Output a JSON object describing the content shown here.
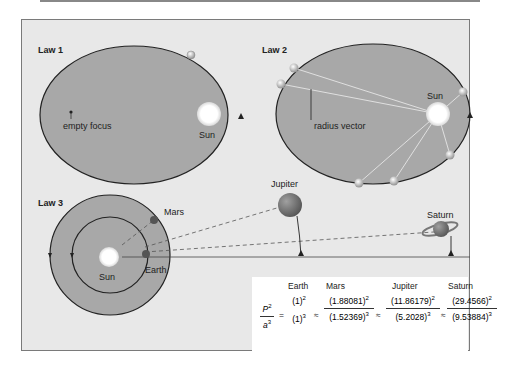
{
  "diagram": {
    "panels": [
      {
        "id": "law1",
        "label": "Law 1",
        "annotations": [
          "empty focus",
          "Sun"
        ]
      },
      {
        "id": "law2",
        "label": "Law 2",
        "annotations": [
          "radius vector",
          "Sun"
        ]
      },
      {
        "id": "law3",
        "label": "Law 3",
        "annotations": [
          "Mars",
          "Sun",
          "Earth",
          "Jupiter",
          "Saturn"
        ]
      }
    ],
    "equation": {
      "lhs": {
        "num": "P",
        "num_exp": "2",
        "den": "a",
        "den_exp": "3"
      },
      "eq_sign": "=",
      "approx_sign": "≈",
      "terms": [
        {
          "planet": "Earth",
          "num": "(1)",
          "num_exp": "2",
          "den": "(1)",
          "den_exp": "3"
        },
        {
          "planet": "Mars",
          "num": "(1.88081)",
          "num_exp": "2",
          "den": "(1.52369)",
          "den_exp": "3"
        },
        {
          "planet": "Jupiter",
          "num": "(11.86179)",
          "num_exp": "2",
          "den": "(5.2028)",
          "den_exp": "3"
        },
        {
          "planet": "Saturn",
          "num": "(29.4566)",
          "num_exp": "2",
          "den": "(9.53884)",
          "den_exp": "3"
        }
      ]
    },
    "colors": {
      "background": "#e8e8e8",
      "orbit_fill": "#a8a8a8",
      "frame_border": "#7a7a7a",
      "line": "#222222",
      "sun": "#ffffff"
    }
  }
}
